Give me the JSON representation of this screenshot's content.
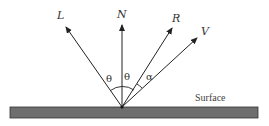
{
  "diagram": {
    "type": "reflection-vectors",
    "colors": {
      "line": "#222222",
      "surface_fill": "#6e6e6e",
      "surface_stroke": "#333333"
    },
    "origin": {
      "x": 122,
      "y": 107
    },
    "vectors": [
      {
        "id": "L",
        "label": "L",
        "tip": {
          "x": 66,
          "y": 27
        },
        "label_pos": {
          "x": 57,
          "y": 19
        }
      },
      {
        "id": "N",
        "label": "N",
        "tip": {
          "x": 122,
          "y": 25
        },
        "label_pos": {
          "x": 117,
          "y": 18
        }
      },
      {
        "id": "R",
        "label": "R",
        "tip": {
          "x": 172,
          "y": 28
        },
        "label_pos": {
          "x": 172,
          "y": 22
        }
      },
      {
        "id": "V",
        "label": "V",
        "tip": {
          "x": 197,
          "y": 38
        },
        "label_pos": {
          "x": 202,
          "y": 35
        }
      }
    ],
    "angles": [
      {
        "label": "θ",
        "pos": {
          "x": 106,
          "y": 82
        }
      },
      {
        "label": "θ",
        "pos": {
          "x": 124,
          "y": 80
        }
      },
      {
        "label": "α",
        "pos": {
          "x": 148,
          "y": 80
        }
      }
    ],
    "surface": {
      "label": "Surface",
      "label_pos": {
        "x": 195,
        "y": 101
      }
    }
  }
}
